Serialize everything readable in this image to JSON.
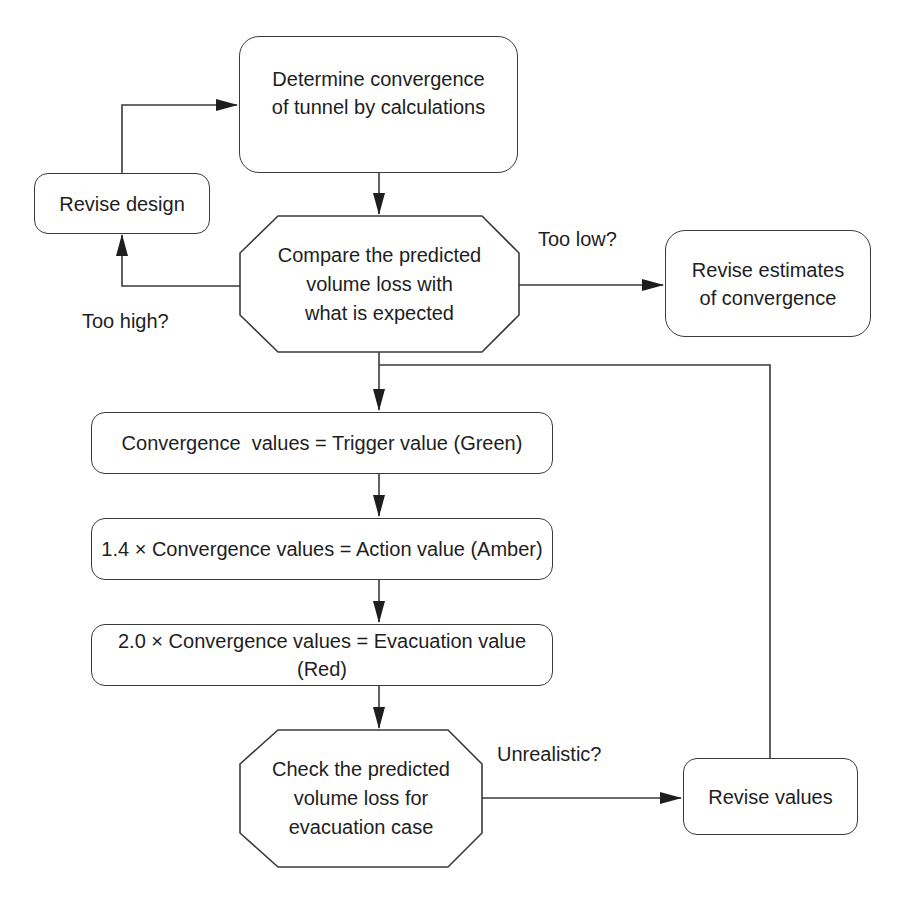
{
  "diagram": {
    "type": "flowchart",
    "nodes": {
      "determine": {
        "shape": "rounded-rect",
        "text": "Determine convergence\nof tunnel by calculations"
      },
      "revise_design": {
        "shape": "rounded-rect",
        "text": "Revise design"
      },
      "compare": {
        "shape": "octagon",
        "text": "Compare the predicted\nvolume loss with\nwhat is expected"
      },
      "revise_estimates": {
        "shape": "rounded-rect",
        "text": "Revise estimates\nof convergence"
      },
      "trigger": {
        "shape": "rounded-rect",
        "text": "Convergence  values = Trigger value (Green)"
      },
      "action": {
        "shape": "rounded-rect",
        "text": "1.4 × Convergence values = Action value (Amber)"
      },
      "evacuation": {
        "shape": "rounded-rect",
        "text": "2.0 × Convergence values = Evacuation value (Red)"
      },
      "check": {
        "shape": "octagon",
        "text": "Check the predicted\nvolume loss for\nevacuation case"
      },
      "revise_values": {
        "shape": "rounded-rect",
        "text": "Revise values"
      }
    },
    "edge_labels": {
      "too_high": "Too high?",
      "too_low": "Too low?",
      "unrealistic": "Unrealistic?"
    },
    "edges": [
      {
        "from": "determine",
        "to": "compare"
      },
      {
        "from": "compare",
        "to": "revise_design",
        "label": "Too high?"
      },
      {
        "from": "revise_design",
        "to": "determine"
      },
      {
        "from": "compare",
        "to": "revise_estimates",
        "label": "Too low?"
      },
      {
        "from": "compare",
        "to": "trigger"
      },
      {
        "from": "trigger",
        "to": "action"
      },
      {
        "from": "action",
        "to": "evacuation"
      },
      {
        "from": "evacuation",
        "to": "check"
      },
      {
        "from": "check",
        "to": "revise_values",
        "label": "Unrealistic?"
      },
      {
        "from": "revise_values",
        "to": "trigger"
      }
    ]
  },
  "colors": {
    "stroke": "#3a3a3a",
    "text": "#1e1e1e",
    "background": "#ffffff"
  }
}
